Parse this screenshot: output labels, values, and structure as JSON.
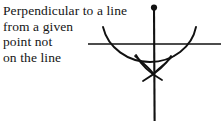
{
  "caption": {
    "lines": [
      "Perpendicular to a line",
      "from a given",
      "point not",
      "on the line"
    ]
  },
  "figure": {
    "stroke_color": "#111111",
    "background_color": "#ffffff",
    "elements": {
      "given_line_label": "given line",
      "given_point_label": "given point",
      "perpendicular_label": "perpendicular line",
      "compass_arc_label": "compass arc through line",
      "bisector_arc_left_label": "bisector arc left",
      "bisector_arc_right_label": "bisector arc right"
    },
    "geometry": {
      "given_point": [
        154,
        7
      ],
      "given_line_y": 44,
      "given_line_x_start": 88,
      "given_line_x_end": 221,
      "perpendicular_x": 154,
      "perpendicular_y_start": 7,
      "perpendicular_y_end": 121,
      "main_arc_left_end": [
        103,
        27
      ],
      "main_arc_right_end": [
        196,
        27
      ],
      "main_arc_bottom": [
        150,
        62
      ],
      "arc_intersections_on_line": [
        [
          119,
          44
        ],
        [
          185,
          44
        ]
      ],
      "bisector_crossing_point": [
        153,
        72
      ]
    }
  }
}
